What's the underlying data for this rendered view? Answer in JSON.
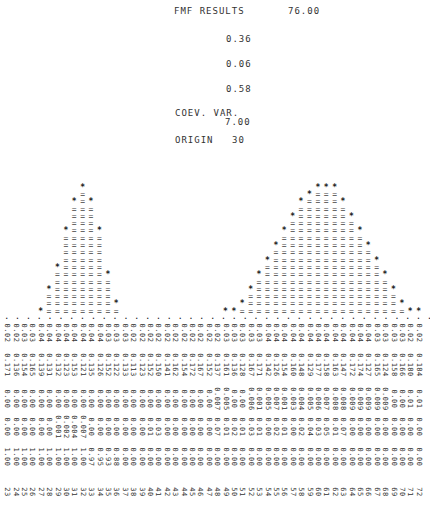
{
  "header": {
    "title": "FMF RESULTS",
    "title_value": "76.00",
    "values": [
      "0.36",
      "0.06",
      "0.58"
    ],
    "coev_label": "COEV. VAR.",
    "coev_value": "7.00",
    "origin_label": "ORIGIN",
    "origin_value": "30"
  },
  "chart_data": {
    "type": "bar",
    "title": "FMF RESULTS",
    "xlabel": "",
    "ylabel": "",
    "grid": false,
    "style": "line-printer histogram (columns of '=' topped by '*')",
    "x": [
      23,
      24,
      25,
      26,
      27,
      28,
      29,
      30,
      31,
      32,
      33,
      34,
      35,
      36,
      37,
      38,
      39,
      40,
      41,
      42,
      43,
      44,
      45,
      46,
      47,
      48,
      49,
      50,
      51,
      52,
      53,
      54,
      55,
      56,
      57,
      58,
      59,
      60,
      61,
      62,
      63,
      64,
      65,
      66,
      67,
      68,
      69,
      70,
      71,
      72
    ],
    "values": [
      0,
      0,
      0,
      0,
      1,
      4,
      7,
      12,
      16,
      18,
      16,
      12,
      6,
      2,
      0,
      0,
      0,
      0,
      0,
      0,
      0,
      0,
      0,
      0,
      0,
      0,
      1,
      1,
      2,
      4,
      6,
      8,
      10,
      12,
      14,
      16,
      17,
      18,
      18,
      18,
      16,
      14,
      12,
      10,
      8,
      6,
      4,
      2,
      1,
      1
    ],
    "row1_label": "0.0x values (rotated)",
    "row1": [
      "0.02",
      "0.02",
      "0.03",
      "0.03",
      "0.04",
      "0.04",
      "0.04",
      "0.04",
      "0.04",
      "0.04",
      "0.04",
      "0.04",
      "0.03",
      "0.03",
      "0.03",
      "0.02",
      "0.02",
      "0.02",
      "0.02",
      "0.02",
      "0.02",
      "0.02",
      "0.02",
      "0.02",
      "0.02",
      "0.02",
      "0.03",
      "0.03",
      "0.03",
      "0.03",
      "0.03",
      "0.04",
      "0.04",
      "0.04",
      "0.04",
      "0.04",
      "0.04",
      "0.04",
      "0.04",
      "0.04",
      "0.04",
      "0.04",
      "0.04",
      "0.04",
      "0.03",
      "0.03",
      "0.03",
      "0.03",
      "0.02",
      "0.02"
    ],
    "index_labels": [
      "23",
      "24",
      "25",
      "26",
      "27",
      "28",
      "29",
      "30",
      "31",
      "32",
      "33",
      "34",
      "35",
      "36",
      "37",
      "38",
      "39",
      "40",
      "41",
      "42",
      "43",
      "44",
      "45",
      "46",
      "47",
      "48",
      "49",
      "50",
      "51",
      "52",
      "53",
      "54",
      "55",
      "56",
      "57",
      "58",
      "59",
      "60",
      "61",
      "62",
      "63",
      "64",
      "65",
      "66",
      "67",
      "68",
      "69",
      "70",
      "71",
      "72"
    ]
  },
  "data_rows": {
    "row2": [
      "0.171",
      "0.136",
      "0.154",
      "0.165",
      "0.139",
      "0.131",
      "0.132",
      "0.123",
      "0.153",
      "0.121",
      "0.135",
      "0.126",
      "0.152",
      "0.122",
      "0.133",
      "0.113",
      "0.123",
      "0.152",
      "0.150",
      "0.141",
      "0.162",
      "0.154",
      "0.172",
      "0.167",
      "0.152",
      "0.137",
      "0.161",
      "0.136",
      "0.128",
      "0.167",
      "0.171",
      "0.142",
      "0.126",
      "0.154",
      "0.160",
      "0.148",
      "0.129",
      "0.177",
      "0.158",
      "0.163",
      "0.147",
      "0.172",
      "0.174",
      "0.127",
      "0.165",
      "0.124",
      "0.158",
      "0.166",
      "0.180",
      "0.184"
    ],
    "row3": [
      "0.00",
      "0.00",
      "0.00",
      "0.00",
      "0.00",
      "0.00",
      "0.00",
      "0.00",
      "0.00",
      "0.00",
      "0.00",
      "0.00",
      "0.00",
      "0.00",
      "0.00",
      "0.00",
      "0.00",
      "0.00",
      "0.00",
      "0.00",
      "0.00",
      "0.00",
      "0.00",
      "0.00",
      "0.00",
      "0.007",
      "0.005",
      "0.00",
      "0.00",
      "0.006",
      "0.001",
      "0.005",
      "0.007",
      "0.001",
      "0.003",
      "0.004",
      "0.005",
      "0.006",
      "0.007",
      "0.008",
      "0.008",
      "0.009",
      "0.009",
      "0.009",
      "0.009",
      "0.009",
      "0.00",
      "0.00",
      "0.01",
      "0.01"
    ],
    "row4": [
      "0.00",
      "0.00",
      "0.00",
      "0.00",
      "0.00",
      "0.00",
      "0.001",
      "0.002",
      "0.004",
      "0.007",
      "0.00",
      "0.00",
      "0.00",
      "0.00",
      "0.00",
      "0.00",
      "0.00",
      "0.01",
      "0.03",
      "0.00",
      "0.00",
      "0.00",
      "0.00",
      "0.00",
      "0.00",
      "0.07",
      "0.01",
      "0.02",
      "0.01",
      "0.03",
      "0.01",
      "0.00",
      "0.02",
      "0.01",
      "0.00",
      "0.02",
      "0.04",
      "0.03",
      "0.05",
      "0.01",
      "0.07",
      "0.00",
      "0.00",
      "0.00",
      "0.00",
      "0.00",
      "0.00",
      "0.00",
      "0.00",
      "0.00"
    ],
    "row5": [
      "1.00",
      "1.00",
      "1.00",
      "1.00",
      "1.00",
      "1.00",
      "1.00",
      "1.00",
      "1.00",
      "1.00",
      "0.97",
      "0.95",
      "0.93",
      "0.88",
      "0.00",
      "0.00",
      "0.00",
      "0.00",
      "0.00",
      "0.00",
      "0.00",
      "0.00",
      "0.00",
      "0.00",
      "0.00",
      "0.00",
      "0.00",
      "0.00",
      "0.00",
      "0.00",
      "0.00",
      "0.00",
      "0.00",
      "0.00",
      "0.00",
      "0.00",
      "0.00",
      "0.00",
      "0.00",
      "0.00",
      "0.00",
      "0.00",
      "0.00",
      "0.00",
      "0.00",
      "0.00",
      "0.00",
      "0.00",
      "0.00",
      "0.00"
    ]
  }
}
